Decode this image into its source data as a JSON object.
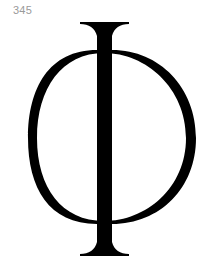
{
  "page": {
    "number": "345"
  },
  "glyph": {
    "character": "Φ",
    "name": "Greek capital letter Phi",
    "color": "#000000"
  }
}
